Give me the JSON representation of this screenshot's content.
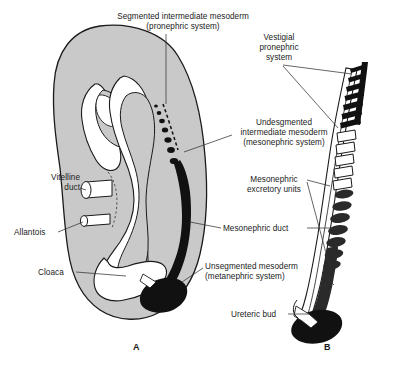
{
  "figure": {
    "colors": {
      "body_fill": "#c9c9c9",
      "body_outline": "#1a1a1a",
      "cavity_fill": "#ffffff",
      "duct_dark": "#111111",
      "leader_line": "#333333",
      "text": "#1a1a1a",
      "background": "#ffffff"
    },
    "panels": [
      {
        "id": "A",
        "letter": "A",
        "x": 133,
        "y": 348
      },
      {
        "id": "B",
        "letter": "B",
        "x": 324,
        "y": 348
      }
    ],
    "labels": [
      {
        "id": "segmented-intermediate-mesoderm",
        "lines": [
          "Segmented intermediate mesoderm",
          "(pronephric system)"
        ],
        "align": "center",
        "x": 103,
        "y": 12,
        "width": 160
      },
      {
        "id": "vestigial-pronephric-system",
        "lines": [
          "Vestigial",
          "pronephric",
          "system"
        ],
        "align": "center",
        "x": 248,
        "y": 33,
        "width": 62
      },
      {
        "id": "undesgmented-intermediate-mesoderm",
        "lines": [
          "Undesgmented",
          "intermediate mesoderm",
          "(mesonephric system)"
        ],
        "align": "center",
        "x": 228,
        "y": 118,
        "width": 112
      },
      {
        "id": "mesonephric-excretory-units",
        "lines": [
          "Mesonephric",
          "excretory units"
        ],
        "align": "center",
        "x": 236,
        "y": 175,
        "width": 76
      },
      {
        "id": "mesonephric-duct",
        "lines": [
          "Mesonephric duct"
        ],
        "align": "left",
        "x": 223,
        "y": 224,
        "width": 82
      },
      {
        "id": "unsegmented-mesoderm",
        "lines": [
          "Unsegmented mesoderm",
          "(metanephric system)"
        ],
        "align": "left",
        "x": 205,
        "y": 262,
        "width": 114
      },
      {
        "id": "ureteric-bud",
        "lines": [
          "Ureteric bud"
        ],
        "align": "left",
        "x": 231,
        "y": 310,
        "width": 62
      },
      {
        "id": "vitelline-duct",
        "lines": [
          "Vitelline",
          "duct"
        ],
        "align": "right",
        "x": 36,
        "y": 173,
        "width": 48
      },
      {
        "id": "allantois",
        "lines": [
          "Allantois"
        ],
        "align": "left",
        "x": 14,
        "y": 228,
        "width": 46
      },
      {
        "id": "cloaca",
        "lines": [
          "Cloaca"
        ],
        "align": "left",
        "x": 38,
        "y": 268,
        "width": 40
      }
    ]
  },
  "diagram_data": {
    "type": "diagram",
    "subject": "Embryonic nephric system development",
    "panel_a": {
      "description": "Sagittal view of embryo showing intermediate mesoderm gradient",
      "pronephric_dots": [
        {
          "cx": 156,
          "cy": 107,
          "rx": 2.0,
          "ry": 1.7
        },
        {
          "cx": 159,
          "cy": 113,
          "rx": 2.3,
          "ry": 2.0
        },
        {
          "cx": 162,
          "cy": 120,
          "rx": 2.8,
          "ry": 2.3
        },
        {
          "cx": 165,
          "cy": 128,
          "rx": 3.2,
          "ry": 2.6
        },
        {
          "cx": 168,
          "cy": 137,
          "rx": 3.6,
          "ry": 2.8
        },
        {
          "cx": 171,
          "cy": 147,
          "rx": 4.0,
          "ry": 3.0
        },
        {
          "cx": 174,
          "cy": 158,
          "rx": 4.3,
          "ry": 3.2
        }
      ],
      "dashed_streak": true,
      "mesonephric_duct_band": true,
      "metanephric_blastema": true
    },
    "panel_b": {
      "description": "Isolated nephric duct system with tubules",
      "vestigial_pronephric_tubules": 7,
      "open_outlined_tubules": 5,
      "filled_mesonephric_units": 7,
      "ureteric_bud": true,
      "metanephric_mass": true
    }
  }
}
